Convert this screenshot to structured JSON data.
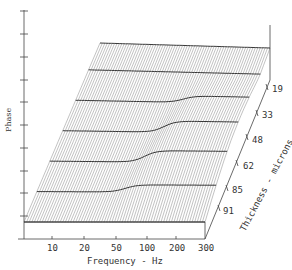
{
  "chart_data": {
    "type": "surface-3d",
    "title": "",
    "xlabel": "Frequency - Hz",
    "ylabel": "Phase",
    "zlabel": "Thickness - microns",
    "x_ticks": [
      "10",
      "20",
      "50",
      "100",
      "200",
      "300"
    ],
    "depth_ticks": [
      "19",
      "33",
      "48",
      "62",
      "85",
      "91"
    ],
    "phase_tick_count": 10,
    "series": [
      {
        "name": "19",
        "note": "smooth, slight rise near 50-100 Hz"
      },
      {
        "name": "33",
        "note": "step transition near ~60 Hz"
      },
      {
        "name": "48",
        "note": "step transition near ~55 Hz"
      },
      {
        "name": "62",
        "note": "step transition near ~50 Hz"
      },
      {
        "name": "85",
        "note": "sharp step near ~50 Hz"
      },
      {
        "name": "91",
        "note": "flat"
      }
    ],
    "grid": false,
    "legend": "none"
  },
  "labels": {
    "xlabel": "Frequency - Hz",
    "ylabel": "Phase",
    "zlabel": "Thickness - microns",
    "x_ticks": [
      "10",
      "20",
      "50",
      "100",
      "200",
      "300"
    ],
    "depth_ticks": [
      "19",
      "33",
      "48",
      "62",
      "85",
      "91"
    ]
  }
}
